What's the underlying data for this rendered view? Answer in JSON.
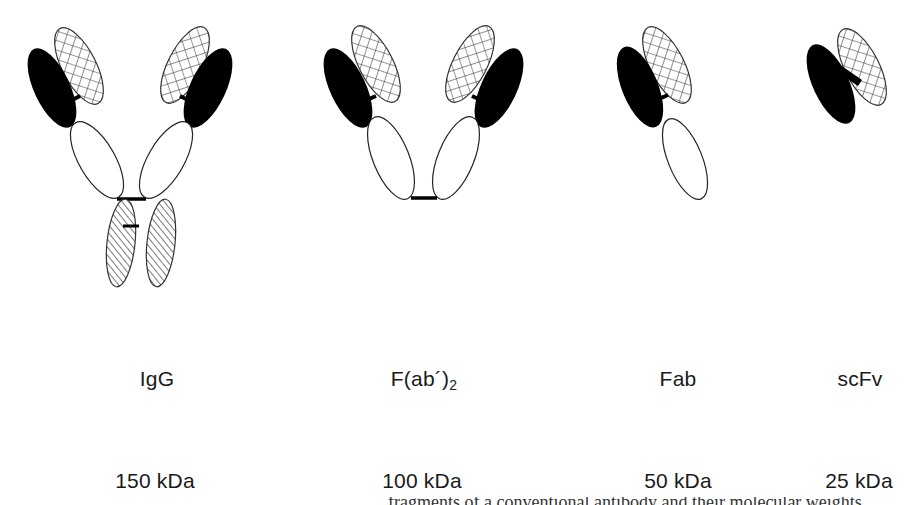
{
  "figure": {
    "colors": {
      "heavy_variable": "#000000",
      "light_variable": "crosshatch",
      "constant": "#ffffff",
      "fc": "diagonal-hatch",
      "stroke": "#222222"
    },
    "formats": [
      {
        "name": "IgG",
        "name_main": "IgG",
        "name_sub": "",
        "mass": "150 kDa"
      },
      {
        "name": "F(ab′)2",
        "name_main": "F(ab´)",
        "name_sub": "2",
        "mass": "100 kDa"
      },
      {
        "name": "Fab",
        "name_main": "Fab",
        "name_sub": "",
        "mass": "50 kDa"
      },
      {
        "name": "scFv",
        "name_main": "scFv",
        "name_sub": "",
        "mass": "25 kDa"
      }
    ],
    "caption_fragment": "…fragments of a conventional antibody and their molecular weights…"
  }
}
